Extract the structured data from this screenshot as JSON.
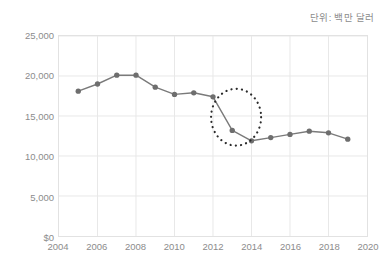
{
  "caption": {
    "unit_note": "단위: 백만 달러"
  },
  "colors": {
    "series_line": "#7a7a7a",
    "marker": "#6e6e6e",
    "gridline": "#e8e8e8",
    "plot_border": "#e2e2e2",
    "tick_text": "#8c8c8c",
    "annotation": "#2b2b2b",
    "background": "#ffffff"
  },
  "chart_data": {
    "type": "line",
    "title": "",
    "subtitle": "",
    "xlabel": "",
    "ylabel": "",
    "unit_note": "단위: 백만 달러",
    "xlim": [
      2004,
      2020
    ],
    "ylim": [
      0,
      25000
    ],
    "grid": true,
    "legend": false,
    "legend_position": "none",
    "x_tick_labels": [
      "2004",
      "2006",
      "2008",
      "2010",
      "2012",
      "2014",
      "2016",
      "2018",
      "2020"
    ],
    "x_ticks": [
      2004,
      2006,
      2008,
      2010,
      2012,
      2014,
      2016,
      2018,
      2020
    ],
    "y_tick_labels": [
      "$0",
      "5,000",
      "10,000",
      "15,000",
      "20,000",
      "25,000"
    ],
    "y_ticks": [
      0,
      5000,
      10000,
      15000,
      20000,
      25000
    ],
    "x": [
      2005,
      2006,
      2007,
      2008,
      2009,
      2010,
      2011,
      2012,
      2013,
      2014,
      2015,
      2016,
      2017,
      2018,
      2019
    ],
    "values": [
      18100,
      19000,
      20100,
      20100,
      18600,
      17700,
      17900,
      17400,
      13200,
      11900,
      12300,
      12700,
      13100,
      12900,
      12100
    ],
    "series": [
      {
        "name": "",
        "x": [
          2005,
          2006,
          2007,
          2008,
          2009,
          2010,
          2011,
          2012,
          2013,
          2014,
          2015,
          2016,
          2017,
          2018,
          2019
        ],
        "values": [
          18100,
          19000,
          20100,
          20100,
          18600,
          17700,
          17900,
          17400,
          13200,
          11900,
          12300,
          12700,
          13100,
          12900,
          12100
        ],
        "marker": "circle",
        "color": "#7a7a7a"
      }
    ],
    "annotations": [
      {
        "type": "ellipse",
        "style": "dotted",
        "label": "",
        "x_range": [
          2011.9,
          2014.5
        ],
        "y_range": [
          11300,
          18400
        ],
        "highlights_years": [
          2012,
          2013
        ]
      }
    ]
  }
}
